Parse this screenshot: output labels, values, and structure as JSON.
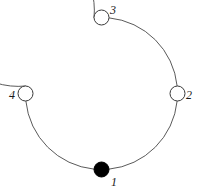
{
  "figure": {
    "kind": "cycle-graph-diagram",
    "width": 204,
    "height": 194,
    "background_color": "#ffffff",
    "edge_color": "#5a5a5a",
    "edge_width": 1,
    "node_outline_color": "#3a3a3a",
    "node_filled_color": "#000000",
    "node_unfilled_color": "#ffffff",
    "node_radius": 7.5,
    "label_color": "#1a1a1a",
    "cycle": {
      "center_x": 101.5,
      "center_y": 93.5,
      "radius": 76
    }
  },
  "nodes": [
    {
      "id": "node-1",
      "label": "1",
      "fill": "filled",
      "cx": 101.5,
      "cy": 169.5,
      "label_x": 111,
      "label_y": 176
    },
    {
      "id": "node-2",
      "label": "2",
      "fill": "open",
      "cx": 177.5,
      "cy": 93.5,
      "label_x": 186,
      "label_y": 89
    },
    {
      "id": "node-3",
      "label": "3",
      "fill": "open",
      "cx": 101.5,
      "cy": 17.5,
      "label_x": 110,
      "label_y": 4
    },
    {
      "id": "node-4",
      "label": "4",
      "fill": "open",
      "cx": 25.5,
      "cy": 93.5,
      "label_x": 9,
      "label_y": 89
    }
  ],
  "edges": [
    {
      "id": "edge-1-2",
      "from": "node-1",
      "to": "node-2"
    },
    {
      "id": "edge-2-3",
      "from": "node-2",
      "to": "node-3"
    },
    {
      "id": "edge-3-4",
      "from": "node-3",
      "to": "node-4"
    },
    {
      "id": "edge-4-1",
      "from": "node-4",
      "to": "node-1"
    }
  ]
}
